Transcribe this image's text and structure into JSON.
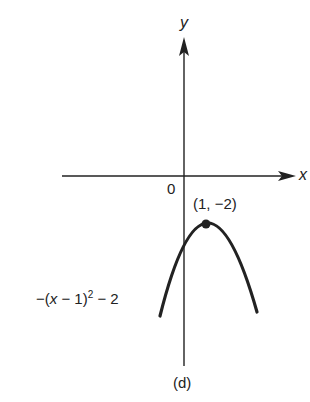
{
  "figure": {
    "x_axis_label": "x",
    "y_axis_label": "y",
    "origin_label": "0",
    "vertex_label": "(1, −2)",
    "curve_label_prefix": "−(",
    "curve_label_var": "x",
    "curve_label_mid": " − 1)",
    "curve_label_exp": "2",
    "curve_label_suffix": " − 2",
    "caption": "(d)"
  },
  "colors": {
    "ink": "#222222",
    "background": "#ffffff"
  }
}
